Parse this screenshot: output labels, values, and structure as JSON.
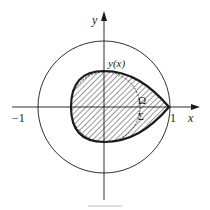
{
  "figure": {
    "axes": {
      "x_label": "x",
      "y_label": "y",
      "tick_neg": "−1",
      "tick_pos": "1"
    },
    "curve_label": "y(x)",
    "region_label": "Ω",
    "boundary_label": "Σ",
    "colors": {
      "ink": "#1a1a1a",
      "background": "#ffffff",
      "hatch": "#333333"
    }
  }
}
